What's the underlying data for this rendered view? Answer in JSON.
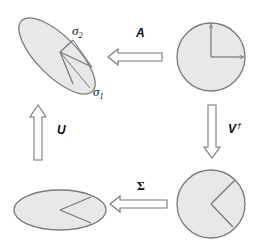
{
  "diagram": {
    "type": "svd-geometric-interpretation",
    "colors": {
      "shape_fill": "#e8e8e8",
      "shape_stroke": "#7a7a7a",
      "arrow_fill": "#ffffff",
      "arrow_stroke": "#777777",
      "text": "#111111"
    },
    "nodes": [
      {
        "id": "unit-circle",
        "shape": "circle",
        "position": "top-right"
      },
      {
        "id": "rotated-circle",
        "shape": "circle",
        "position": "bottom-right"
      },
      {
        "id": "scaled-ellipse",
        "shape": "ellipse",
        "position": "bottom-left"
      },
      {
        "id": "final-ellipse",
        "shape": "rotated-ellipse",
        "position": "top-left"
      }
    ],
    "arrows": [
      {
        "id": "arrow-a",
        "label": "A",
        "from": "unit-circle",
        "to": "final-ellipse",
        "direction": "left"
      },
      {
        "id": "arrow-vt",
        "label": "V",
        "superscript": "†",
        "from": "unit-circle",
        "to": "rotated-circle",
        "direction": "down"
      },
      {
        "id": "arrow-sigma",
        "label": "Σ",
        "from": "rotated-circle",
        "to": "scaled-ellipse",
        "direction": "left"
      },
      {
        "id": "arrow-u",
        "label": "U",
        "from": "scaled-ellipse",
        "to": "final-ellipse",
        "direction": "up"
      }
    ],
    "labels": {
      "a": "A",
      "vt": "V",
      "vt_sup": "†",
      "sigma": "Σ",
      "u": "U",
      "sigma1": "σ",
      "sigma1_sub": "1",
      "sigma2": "σ",
      "sigma2_sub": "2"
    }
  }
}
